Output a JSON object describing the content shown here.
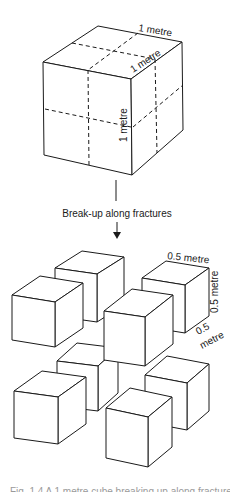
{
  "diagram": {
    "big_cube": {
      "labels": {
        "top_back_edge": "1 metre",
        "top_right_edge": "1 metre",
        "front_vertical_edge": "1 metre"
      },
      "vertices": {
        "ftl": [
          43,
          62
        ],
        "ftr": [
          131,
          79
        ],
        "fbl": [
          44,
          155
        ],
        "fbr": [
          132,
          175
        ],
        "btl": [
          98,
          26
        ],
        "btr": [
          182,
          42
        ],
        "bbr": [
          183,
          130
        ]
      }
    },
    "process_label": "Break-up along fractures",
    "small_cube_labels": {
      "top_edge": "0.5 metre",
      "right_vertical_edge": "0.5 metre",
      "depth_edge_line1": "0.5",
      "depth_edge_line2": "metre"
    },
    "small_cubes": [
      {
        "id": "A",
        "ftl": [
          55,
          268
        ],
        "w": 42,
        "h": 48,
        "dx": 27,
        "dy": -17,
        "skew": 6
      },
      {
        "id": "C",
        "ftl": [
          142,
          278
        ],
        "w": 43,
        "h": 48,
        "dx": 24,
        "dy": -17,
        "skew": 7
      },
      {
        "id": "B",
        "ftl": [
          12,
          295
        ],
        "w": 43,
        "h": 45,
        "dx": 28,
        "dy": -19,
        "skew": 7
      },
      {
        "id": "E",
        "ftl": [
          57,
          361
        ],
        "w": 41,
        "h": 45,
        "dx": 20,
        "dy": -18,
        "skew": 5
      },
      {
        "id": "G",
        "ftl": [
          145,
          375
        ],
        "w": 42,
        "h": 47,
        "dx": 22,
        "dy": -19,
        "skew": 8
      },
      {
        "id": "D",
        "ftl": [
          104,
          311
        ],
        "w": 41,
        "h": 49,
        "dx": 28,
        "dy": -22,
        "skew": 6
      },
      {
        "id": "F",
        "ftl": [
          14,
          391
        ],
        "w": 44,
        "h": 47,
        "dx": 28,
        "dy": -20,
        "skew": 6
      },
      {
        "id": "H",
        "ftl": [
          106,
          408
        ],
        "w": 42,
        "h": 50,
        "dx": 24,
        "dy": -20,
        "skew": 9
      }
    ],
    "caption": "Fig. 1.4  A 1 metre cube breaking up along fractures into 0.5 metre cubes"
  }
}
